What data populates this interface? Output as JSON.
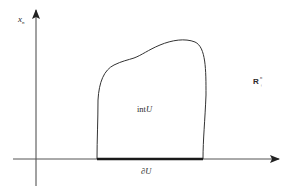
{
  "figure": {
    "type": "math-diagram",
    "labels": {
      "vertical_axis": "x",
      "vertical_axis_subscript": "n",
      "space": "R",
      "space_superscript": "n",
      "space_subscript": "+",
      "interior": "int",
      "interior_var": "U",
      "boundary": "∂",
      "boundary_var": "U"
    },
    "colors": {
      "stroke": "#333333",
      "boundary_stroke": "#1a1a1a",
      "background": "#ffffff"
    }
  }
}
